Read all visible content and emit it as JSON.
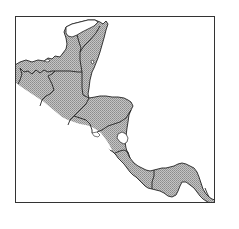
{
  "map": {
    "region": "Central America",
    "type": "distribution-map",
    "frame": {
      "x": 15,
      "y": 16,
      "width": 200,
      "height": 187
    },
    "colors": {
      "background": "#ffffff",
      "frame_stroke": "#333333",
      "land_fill": "#b8b8b8",
      "stipple_dot": "#8c8c8c",
      "border_stroke": "#222222",
      "unshaded_land": "#ffffff"
    },
    "legend": [],
    "labels": []
  }
}
